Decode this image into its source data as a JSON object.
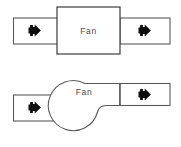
{
  "canvas": {
    "width": 181,
    "height": 147,
    "background": "#ffffff",
    "line_color": "#5a5a5a",
    "box_line_color": "#3c3c3c",
    "arrow_color": "#0d0d0d",
    "label_color": "#4a4a4a"
  },
  "diagrams": [
    {
      "id": "axial-fan-diagram",
      "label": "Fan",
      "inlet_arrow": "right-arrow-icon",
      "outlet_arrow": "right-arrow-icon"
    },
    {
      "id": "centrifugal-fan-diagram",
      "label": "Fan",
      "inlet_arrow": "right-arrow-icon",
      "outlet_arrow": "right-arrow-icon"
    }
  ],
  "top": {
    "fan_label": "Fan",
    "inlet_duct_name": "inlet-duct",
    "outlet_duct_name": "outlet-duct",
    "inlet_arrow_name": "right-arrow-icon",
    "outlet_arrow_name": "right-arrow-icon"
  },
  "bottom": {
    "fan_label": "Fan",
    "inlet_duct_name": "inlet-duct",
    "outlet_duct_name": "outlet-duct",
    "inlet_arrow_name": "right-arrow-icon",
    "outlet_arrow_name": "right-arrow-icon"
  }
}
